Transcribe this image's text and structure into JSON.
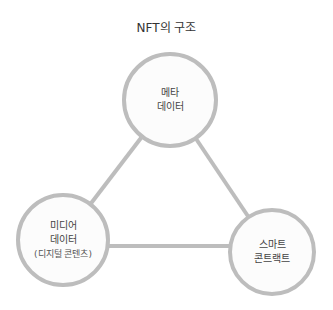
{
  "title": "NFT의 구조",
  "colors": {
    "stroke": "#bdbdbd",
    "fill": "#fcfcfc",
    "text": "#444444"
  },
  "nodes": [
    {
      "id": "meta",
      "lines": [
        "메타",
        "데이터"
      ]
    },
    {
      "id": "media",
      "lines": [
        "미디어",
        "데이터"
      ],
      "sub": "(디지털 콘텐츠)"
    },
    {
      "id": "contract",
      "lines": [
        "스마트",
        "콘트랙트"
      ]
    }
  ],
  "edges": [
    [
      "meta",
      "media"
    ],
    [
      "meta",
      "contract"
    ],
    [
      "media",
      "contract"
    ]
  ]
}
